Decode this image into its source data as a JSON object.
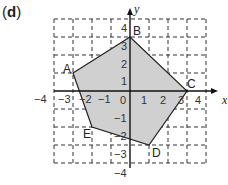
{
  "figure": {
    "label_open": "(",
    "label_letter": "d",
    "label_close": ")"
  },
  "axes": {
    "x_label": "x",
    "y_label": "y",
    "x_ticks": [
      "−4",
      "−3",
      "−2",
      "−1",
      "0",
      "1",
      "2",
      "3",
      "4"
    ],
    "y_ticks_pos": [
      "4",
      "3",
      "2",
      "1"
    ],
    "y_ticks_neg": [
      "−1",
      "−2",
      "−3",
      "−4"
    ],
    "range": {
      "x": [
        -4,
        4
      ],
      "y": [
        -4,
        4
      ]
    },
    "grid": "dashed"
  },
  "polygon": {
    "fill": "#d0d0d0",
    "stroke": "#222222",
    "vertices": [
      {
        "name": "A",
        "x": -3,
        "y": 1
      },
      {
        "name": "B",
        "x": 0,
        "y": 3
      },
      {
        "name": "C",
        "x": 3,
        "y": 0
      },
      {
        "name": "D",
        "x": 1,
        "y": -3
      },
      {
        "name": "E",
        "x": -2,
        "y": -2
      }
    ]
  }
}
